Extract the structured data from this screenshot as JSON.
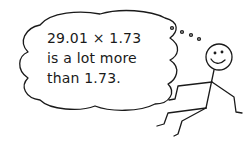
{
  "illustration": {
    "thought_bubble": {
      "lines": [
        "29.01 × 1.73",
        "is a lot more",
        "than 1.73."
      ]
    },
    "figure": "smiling-stick-figure",
    "colors": {
      "ink": "#1a1a1a",
      "background": "#ffffff"
    }
  }
}
